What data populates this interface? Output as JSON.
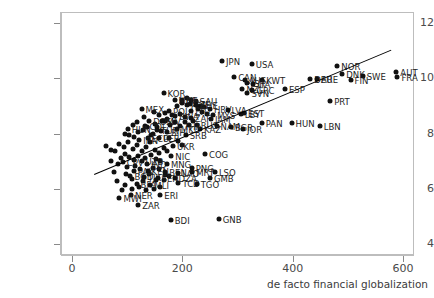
{
  "chart_data": {
    "type": "scatter",
    "title": "",
    "xlabel": "de facto financial globalization",
    "ylabel": "",
    "xlim": [
      -20,
      620
    ],
    "ylim": [
      3.6,
      12.4
    ],
    "xticks": [
      0,
      200,
      400,
      600
    ],
    "yticks": [
      4,
      6,
      8,
      10,
      12
    ],
    "grid": false,
    "legend": "none",
    "point_color": "#111111",
    "fit_line": {
      "x0": 40,
      "y0": 6.55,
      "x1": 578,
      "y1": 11.05,
      "color": "#000000"
    },
    "points": [
      {
        "label": "JPN",
        "x": 272,
        "y": 10.62
      },
      {
        "label": "USA",
        "x": 326,
        "y": 10.52
      },
      {
        "label": "NOR",
        "x": 481,
        "y": 10.46
      },
      {
        "label": "CAN",
        "x": 294,
        "y": 10.05
      },
      {
        "label": "AUS",
        "x": 313,
        "y": 9.93
      },
      {
        "label": "AUT",
        "x": 588,
        "y": 10.22
      },
      {
        "label": "FRA",
        "x": 590,
        "y": 10.05
      },
      {
        "label": "DNK",
        "x": 490,
        "y": 10.14
      },
      {
        "label": "SWE",
        "x": 527,
        "y": 10.1
      },
      {
        "label": "FIN",
        "x": 505,
        "y": 9.95
      },
      {
        "label": "DEU",
        "x": 432,
        "y": 9.98
      },
      {
        "label": "ARE",
        "x": 444,
        "y": 9.98
      },
      {
        "label": "KWT",
        "x": 345,
        "y": 9.92
      },
      {
        "label": "ISR",
        "x": 318,
        "y": 9.82
      },
      {
        "label": "ITA",
        "x": 329,
        "y": 9.78
      },
      {
        "label": "NZL",
        "x": 309,
        "y": 9.6
      },
      {
        "label": "SVN",
        "x": 318,
        "y": 9.48
      },
      {
        "label": "GRC",
        "x": 327,
        "y": 9.56
      },
      {
        "label": "KOR",
        "x": 166,
        "y": 9.47
      },
      {
        "label": "ESP",
        "x": 386,
        "y": 9.6
      },
      {
        "label": "PRT",
        "x": 468,
        "y": 9.19
      },
      {
        "label": "SAU",
        "x": 224,
        "y": 9.19
      },
      {
        "label": "FIJ",
        "x": 199,
        "y": 9.23
      },
      {
        "label": "MNE",
        "x": 186,
        "y": 9.2
      },
      {
        "label": "CZE",
        "x": 213,
        "y": 9.06
      },
      {
        "label": "POL",
        "x": 208,
        "y": 9.02
      },
      {
        "label": "CHE",
        "x": 225,
        "y": 9.02
      },
      {
        "label": "MEX",
        "x": 126,
        "y": 8.88
      },
      {
        "label": "HRV",
        "x": 250,
        "y": 8.88
      },
      {
        "label": "LVA",
        "x": 282,
        "y": 8.85
      },
      {
        "label": "LTU",
        "x": 216,
        "y": 8.82
      },
      {
        "label": "POL2",
        "x": 176,
        "y": 8.82
      },
      {
        "label": "MYS",
        "x": 256,
        "y": 8.68
      },
      {
        "label": "BWA",
        "x": 187,
        "y": 8.62
      },
      {
        "label": "ZAF",
        "x": 215,
        "y": 8.56
      },
      {
        "label": "JAM",
        "x": 252,
        "y": 8.52
      },
      {
        "label": "DOM",
        "x": 140,
        "y": 8.45
      },
      {
        "label": "SLV",
        "x": 163,
        "y": 8.45
      },
      {
        "label": "RUS",
        "x": 226,
        "y": 8.31
      },
      {
        "label": "NAM",
        "x": 262,
        "y": 8.28
      },
      {
        "label": "COL",
        "x": 133,
        "y": 8.28
      },
      {
        "label": "THA",
        "x": 196,
        "y": 8.26
      },
      {
        "label": "BGR",
        "x": 288,
        "y": 8.22
      },
      {
        "label": "JOR",
        "x": 310,
        "y": 8.15
      },
      {
        "label": "HUN",
        "x": 398,
        "y": 8.38
      },
      {
        "label": "LBN",
        "x": 449,
        "y": 8.28
      },
      {
        "label": "PAN",
        "x": 344,
        "y": 8.38
      },
      {
        "label": "EST",
        "x": 312,
        "y": 8.74
      },
      {
        "label": "LBY",
        "x": 306,
        "y": 8.7
      },
      {
        "label": "HUN2",
        "x": 101,
        "y": 8.18
      },
      {
        "label": "KAZ",
        "x": 232,
        "y": 8.18
      },
      {
        "label": "MKD",
        "x": 190,
        "y": 8.16
      },
      {
        "label": "TUR",
        "x": 154,
        "y": 8.12
      },
      {
        "label": "BIH",
        "x": 172,
        "y": 8.05
      },
      {
        "label": "SRB",
        "x": 206,
        "y": 7.93
      },
      {
        "label": "ECU",
        "x": 137,
        "y": 7.85
      },
      {
        "label": "PER",
        "x": 158,
        "y": 7.82
      },
      {
        "label": "IRN",
        "x": 122,
        "y": 7.78
      },
      {
        "label": "UKR",
        "x": 183,
        "y": 7.55
      },
      {
        "label": "COG",
        "x": 241,
        "y": 7.25
      },
      {
        "label": "NIC",
        "x": 180,
        "y": 7.2
      },
      {
        "label": "UZB",
        "x": 126,
        "y": 7.0
      },
      {
        "label": "CPV",
        "x": 92,
        "y": 6.95
      },
      {
        "label": "IND",
        "x": 136,
        "y": 6.9
      },
      {
        "label": "MNG",
        "x": 172,
        "y": 6.88
      },
      {
        "label": "PNG",
        "x": 217,
        "y": 6.75
      },
      {
        "label": "PAK",
        "x": 112,
        "y": 6.65
      },
      {
        "label": "KEN",
        "x": 137,
        "y": 6.65
      },
      {
        "label": "BEN",
        "x": 169,
        "y": 6.62
      },
      {
        "label": "LAO",
        "x": 192,
        "y": 6.58
      },
      {
        "label": "MRT",
        "x": 218,
        "y": 6.6
      },
      {
        "label": "LSO",
        "x": 259,
        "y": 6.6
      },
      {
        "label": "GMB",
        "x": 250,
        "y": 6.38
      },
      {
        "label": "BGD",
        "x": 106,
        "y": 6.45
      },
      {
        "label": "TJK",
        "x": 130,
        "y": 6.42
      },
      {
        "label": "SEN",
        "x": 155,
        "y": 6.4
      },
      {
        "label": "DZA",
        "x": 186,
        "y": 6.38
      },
      {
        "label": "TCD",
        "x": 193,
        "y": 6.22
      },
      {
        "label": "TGO",
        "x": 226,
        "y": 6.18
      },
      {
        "label": "BFA",
        "x": 117,
        "y": 6.18
      },
      {
        "label": "MLI",
        "x": 142,
        "y": 6.12
      },
      {
        "label": "NER",
        "x": 107,
        "y": 5.78
      },
      {
        "label": "MWI",
        "x": 86,
        "y": 5.65
      },
      {
        "label": "ERI",
        "x": 160,
        "y": 5.78
      },
      {
        "label": "ZAR",
        "x": 120,
        "y": 5.4
      },
      {
        "label": "BDI",
        "x": 179,
        "y": 4.88
      },
      {
        "label": "GNB",
        "x": 266,
        "y": 4.92
      }
    ],
    "extra_cluster_points": [
      {
        "x": 62,
        "y": 7.55
      },
      {
        "x": 70,
        "y": 7.42
      },
      {
        "x": 78,
        "y": 7.35
      },
      {
        "x": 86,
        "y": 7.62
      },
      {
        "x": 94,
        "y": 7.5
      },
      {
        "x": 102,
        "y": 7.7
      },
      {
        "x": 110,
        "y": 7.45
      },
      {
        "x": 118,
        "y": 7.6
      },
      {
        "x": 126,
        "y": 7.38
      },
      {
        "x": 134,
        "y": 7.52
      },
      {
        "x": 142,
        "y": 7.68
      },
      {
        "x": 150,
        "y": 7.42
      },
      {
        "x": 158,
        "y": 7.3
      },
      {
        "x": 166,
        "y": 7.46
      },
      {
        "x": 96,
        "y": 8.0
      },
      {
        "x": 104,
        "y": 7.95
      },
      {
        "x": 112,
        "y": 7.88
      },
      {
        "x": 120,
        "y": 8.05
      },
      {
        "x": 128,
        "y": 8.12
      },
      {
        "x": 146,
        "y": 8.0
      },
      {
        "x": 162,
        "y": 8.08
      },
      {
        "x": 178,
        "y": 8.3
      },
      {
        "x": 150,
        "y": 8.35
      },
      {
        "x": 168,
        "y": 8.45
      },
      {
        "x": 182,
        "y": 8.68
      },
      {
        "x": 196,
        "y": 8.72
      },
      {
        "x": 204,
        "y": 8.6
      },
      {
        "x": 158,
        "y": 8.68
      },
      {
        "x": 168,
        "y": 8.75
      },
      {
        "x": 148,
        "y": 8.78
      },
      {
        "x": 190,
        "y": 9.0
      },
      {
        "x": 200,
        "y": 9.12
      },
      {
        "x": 208,
        "y": 9.3
      },
      {
        "x": 216,
        "y": 9.22
      },
      {
        "x": 232,
        "y": 9.0
      },
      {
        "x": 240,
        "y": 8.95
      },
      {
        "x": 88,
        "y": 7.1
      },
      {
        "x": 96,
        "y": 7.25
      },
      {
        "x": 104,
        "y": 7.15
      },
      {
        "x": 112,
        "y": 7.05
      },
      {
        "x": 120,
        "y": 7.2
      },
      {
        "x": 132,
        "y": 7.12
      },
      {
        "x": 144,
        "y": 7.22
      },
      {
        "x": 152,
        "y": 7.08
      },
      {
        "x": 160,
        "y": 7.0
      },
      {
        "x": 172,
        "y": 7.35
      },
      {
        "x": 100,
        "y": 6.78
      },
      {
        "x": 114,
        "y": 6.82
      },
      {
        "x": 124,
        "y": 6.7
      },
      {
        "x": 146,
        "y": 6.75
      },
      {
        "x": 158,
        "y": 6.72
      },
      {
        "x": 168,
        "y": 6.5
      },
      {
        "x": 98,
        "y": 6.55
      },
      {
        "x": 108,
        "y": 6.35
      },
      {
        "x": 128,
        "y": 6.28
      },
      {
        "x": 140,
        "y": 6.55
      },
      {
        "x": 152,
        "y": 6.3
      },
      {
        "x": 166,
        "y": 6.3
      },
      {
        "x": 176,
        "y": 6.45
      },
      {
        "x": 96,
        "y": 6.15
      },
      {
        "x": 108,
        "y": 6.0
      },
      {
        "x": 122,
        "y": 6.05
      },
      {
        "x": 134,
        "y": 5.95
      },
      {
        "x": 148,
        "y": 6.0
      },
      {
        "x": 160,
        "y": 6.05
      },
      {
        "x": 90,
        "y": 5.95
      },
      {
        "x": 82,
        "y": 6.28
      },
      {
        "x": 76,
        "y": 6.6
      },
      {
        "x": 84,
        "y": 6.88
      },
      {
        "x": 70,
        "y": 7.0
      },
      {
        "x": 176,
        "y": 7.85
      },
      {
        "x": 192,
        "y": 7.72
      },
      {
        "x": 200,
        "y": 7.6
      },
      {
        "x": 144,
        "y": 7.95
      },
      {
        "x": 136,
        "y": 8.22
      },
      {
        "x": 154,
        "y": 8.22
      },
      {
        "x": 172,
        "y": 8.52
      },
      {
        "x": 186,
        "y": 8.42
      },
      {
        "x": 204,
        "y": 8.42
      },
      {
        "x": 212,
        "y": 8.3
      },
      {
        "x": 220,
        "y": 8.45
      },
      {
        "x": 236,
        "y": 8.78
      },
      {
        "x": 244,
        "y": 8.7
      },
      {
        "x": 228,
        "y": 8.9
      },
      {
        "x": 118,
        "y": 8.42
      },
      {
        "x": 110,
        "y": 8.3
      },
      {
        "x": 130,
        "y": 8.6
      }
    ]
  }
}
